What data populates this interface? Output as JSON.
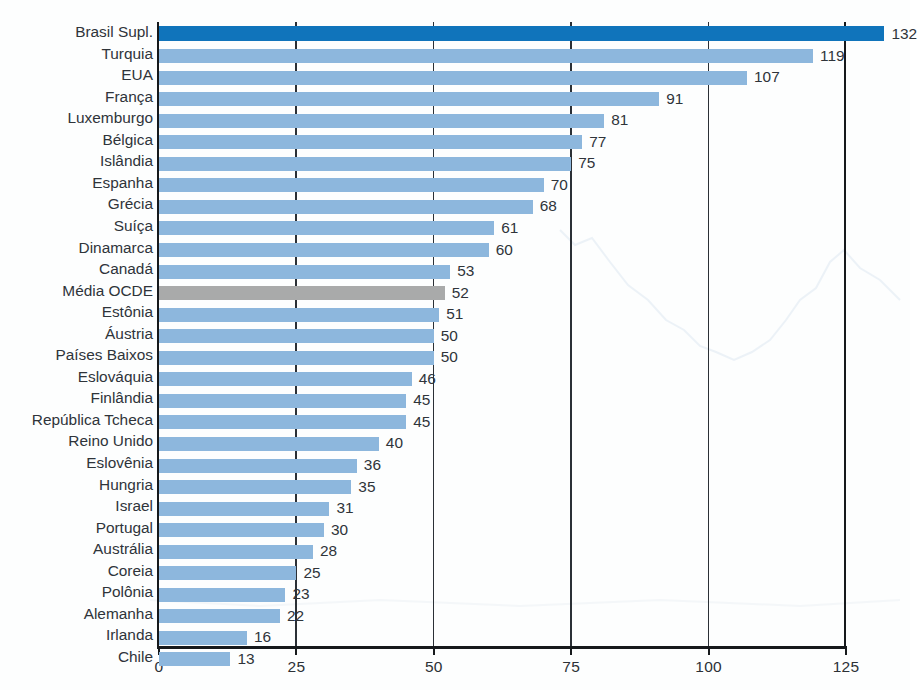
{
  "chart_data": {
    "type": "bar",
    "orientation": "horizontal",
    "title": "",
    "subtitle": "",
    "xlabel": "",
    "ylabel": "",
    "xlim": [
      0,
      125
    ],
    "x_ticks": [
      "0",
      "25",
      "50",
      "75",
      "100",
      "125"
    ],
    "x_tick_values": [
      0,
      25,
      50,
      75,
      100,
      125
    ],
    "grid": "vertical",
    "legend": "none",
    "categories": [
      "Brasil Supl.",
      "Turquia",
      "EUA",
      "França",
      "Luxemburgo",
      "Bélgica",
      "Islândia",
      "Espanha",
      "Grécia",
      "Suíça",
      "Dinamarca",
      "Canadá",
      "Média OCDE",
      "Estônia",
      "Áustria",
      "Países Baixos",
      "Eslováquia",
      "Finlândia",
      "República Tcheca",
      "Reino Unido",
      "Eslovênia",
      "Hungria",
      "Israel",
      "Portugal",
      "Austrália",
      "Coreia",
      "Polônia",
      "Alemanha",
      "Irlanda",
      "Chile"
    ],
    "values": [
      132,
      119,
      107,
      91,
      81,
      77,
      75,
      70,
      68,
      61,
      60,
      53,
      52,
      51,
      50,
      50,
      46,
      45,
      45,
      40,
      36,
      35,
      31,
      30,
      28,
      25,
      23,
      22,
      16,
      13
    ],
    "value_labels": [
      "132",
      "119",
      "107",
      "91",
      "81",
      "77",
      "75",
      "70",
      "68",
      "61",
      "60",
      "53",
      "52",
      "51",
      "50",
      "50",
      "46",
      "45",
      "45",
      "40",
      "36",
      "35",
      "31",
      "30",
      "28",
      "25",
      "23",
      "22",
      "16",
      "13"
    ],
    "bar_styles": [
      "highlight",
      "normal",
      "normal",
      "normal",
      "normal",
      "normal",
      "normal",
      "normal",
      "normal",
      "normal",
      "normal",
      "normal",
      "average",
      "normal",
      "normal",
      "normal",
      "normal",
      "normal",
      "normal",
      "normal",
      "normal",
      "normal",
      "normal",
      "normal",
      "normal",
      "normal",
      "normal",
      "normal",
      "normal",
      "normal"
    ]
  },
  "colors": {
    "bar_normal": "#8db7dd",
    "bar_highlight": "#1074bb",
    "bar_average": "#a9aaaa",
    "axis": "#16191c",
    "grid": "#2b3036",
    "text": "#2f343a",
    "background": "#fdfefe"
  }
}
